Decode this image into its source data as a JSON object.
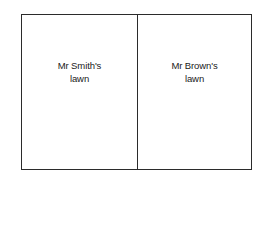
{
  "diagram": {
    "type": "scaled-plan-with-ruler",
    "plan": {
      "plots": [
        {
          "name": "left-plot",
          "label": "Mr Smith's\nlawn"
        },
        {
          "name": "right-plot",
          "label": "Mr Brown's\nlawn"
        }
      ],
      "border_color": "#2b2b2b",
      "fill_color": "#ffffff"
    },
    "scale": {
      "word": "Scale",
      "units": "yards",
      "min": 0,
      "max": 10,
      "tick_step": 1,
      "label_step": 2,
      "tick_labels": [
        "0",
        "2",
        "4",
        "6",
        "8",
        "10"
      ],
      "tick_values": [
        0,
        1,
        2,
        3,
        4,
        5,
        6,
        7,
        8,
        9,
        10
      ],
      "axis_color": "#2b2b2b"
    }
  }
}
